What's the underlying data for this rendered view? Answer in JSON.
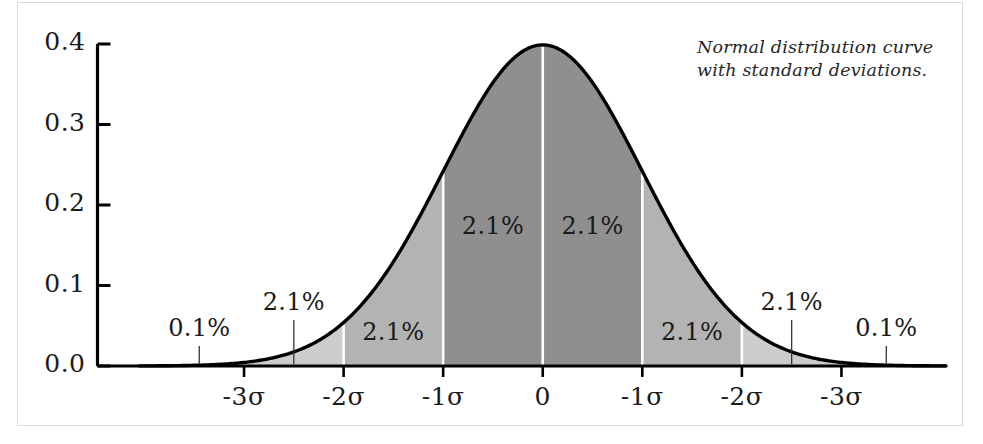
{
  "caption": {
    "line1": "Normal distribution curve",
    "line2": "with standard deviations."
  },
  "chart_data": {
    "type": "area",
    "title": "",
    "subtitle": "",
    "xlabel": "",
    "ylabel": "",
    "grid": false,
    "legend": null,
    "xlim": [
      -4.05,
      4.05
    ],
    "ylim": [
      0.0,
      0.42
    ],
    "yticks": [
      0.0,
      0.1,
      0.2,
      0.3,
      0.4
    ],
    "ytick_labels": [
      "0.0",
      "0.1",
      "0.2",
      "0.3",
      "0.4"
    ],
    "xticks": [
      -3,
      -2,
      -1,
      0,
      1,
      2,
      3
    ],
    "xtick_labels": [
      "-3σ",
      "-2σ",
      "-1σ",
      "0",
      "-1σ",
      "-2σ",
      "-3σ"
    ],
    "curve": {
      "name": "standard normal density",
      "mean": 0,
      "sd": 1,
      "peak_value": 0.4,
      "outline_color": "#000000"
    },
    "bands": [
      {
        "from": -4.05,
        "to": -3,
        "label": "",
        "percent": null,
        "fill": "#f2f2f2"
      },
      {
        "from": -3,
        "to": -2,
        "label": "2.1%",
        "percent": 2.1,
        "fill": "#cccccc"
      },
      {
        "from": -2,
        "to": -1,
        "label": "2.1%",
        "percent": 2.1,
        "fill": "#b3b3b3"
      },
      {
        "from": -1,
        "to": 0,
        "label": "2.1%",
        "percent": 2.1,
        "fill": "#8f8f8f"
      },
      {
        "from": 0,
        "to": 1,
        "label": "2.1%",
        "percent": 2.1,
        "fill": "#8f8f8f"
      },
      {
        "from": 1,
        "to": 2,
        "label": "2.1%",
        "percent": 2.1,
        "fill": "#b3b3b3"
      },
      {
        "from": 2,
        "to": 3,
        "label": "2.1%",
        "percent": 2.1,
        "fill": "#cccccc"
      },
      {
        "from": 3,
        "to": 4.05,
        "label": "",
        "percent": null,
        "fill": "#f2f2f2"
      }
    ],
    "annotations": [
      {
        "text": "0.1%",
        "x": -3.45,
        "leader_to_x": -3.45,
        "placement": "outside-left"
      },
      {
        "text": "2.1%",
        "x": -2.5,
        "leader_to_x": -2.5,
        "placement": "outside-left"
      },
      {
        "text": "2.1%",
        "x": -1.5,
        "leader_to_x": null,
        "placement": "inside"
      },
      {
        "text": "2.1%",
        "x": -0.5,
        "leader_to_x": null,
        "placement": "inside"
      },
      {
        "text": "2.1%",
        "x": 0.5,
        "leader_to_x": null,
        "placement": "inside"
      },
      {
        "text": "2.1%",
        "x": 1.5,
        "leader_to_x": null,
        "placement": "inside"
      },
      {
        "text": "2.1%",
        "x": 2.5,
        "leader_to_x": 2.5,
        "placement": "outside-right"
      },
      {
        "text": "0.1%",
        "x": 3.45,
        "leader_to_x": 3.45,
        "placement": "outside-right"
      }
    ],
    "separator_color": "#ffffff",
    "axis_color": "#000000",
    "frame_color": "#d9d9d9"
  }
}
